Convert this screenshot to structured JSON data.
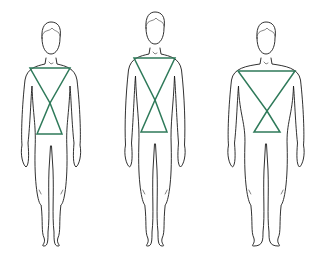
{
  "diagram": {
    "title": "Male body shapes",
    "colors": {
      "outline": "#1a1a1a",
      "triangle": "#2f7a5a",
      "background": "#ffffff"
    },
    "figures": [
      {
        "label": "Figure 1",
        "cx": 51,
        "triangle": {
          "top_y": 68,
          "top_left": 30,
          "top_right": 70,
          "cross": [
            50,
            103
          ],
          "bottom_y": 134,
          "bottom_left": 37,
          "bottom_right": 62
        }
      },
      {
        "label": "Figure 2",
        "cx": 155,
        "triangle": {
          "top_y": 58,
          "top_left": 134,
          "top_right": 175,
          "cross": [
            155,
            100
          ],
          "bottom_y": 132,
          "bottom_left": 141,
          "bottom_right": 167
        }
      },
      {
        "label": "Figure 3",
        "cx": 266,
        "triangle": {
          "top_y": 71,
          "top_left": 238,
          "top_right": 295,
          "cross": [
            267,
            111
          ],
          "bottom_y": 132,
          "bottom_left": 254,
          "bottom_right": 280
        }
      }
    ]
  }
}
